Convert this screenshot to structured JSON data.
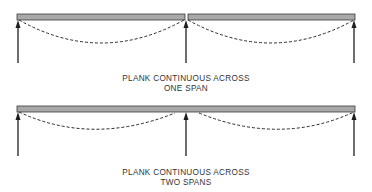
{
  "colors": {
    "plank_fill": "#a8a8a8",
    "plank_stroke": "#3a3a3a",
    "line": "#1e1e1e",
    "dash": "#2a2a2a",
    "text": "#333333"
  },
  "diagrams": [
    {
      "id": "one-span",
      "caption_line1": "PLANK CONTINUOUS ACROSS",
      "caption_line2": "ONE SPAN",
      "plank": "two separate planks, joint over middle support",
      "supports": 3,
      "deflection": "each plank sags independently across one span"
    },
    {
      "id": "two-spans",
      "caption_line1": "PLANK CONTINUOUS ACROSS",
      "caption_line2": "TWO SPANS",
      "plank": "single continuous plank over middle support",
      "supports": 3,
      "deflection": "reduced sag in each span, plank lifts near ends"
    }
  ],
  "icons": {
    "support": "up-arrow-icon",
    "deflected_shape": "dashed-curve"
  }
}
